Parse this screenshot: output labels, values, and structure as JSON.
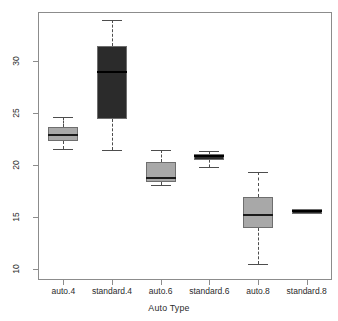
{
  "chart_data": {
    "type": "box",
    "title": "",
    "xlabel": "Auto Type",
    "ylabel": "",
    "ylim": [
      9.0,
      34.6
    ],
    "grid": false,
    "legend": "none",
    "y_ticks": [
      30,
      25,
      20,
      15,
      10
    ],
    "y_tick_labels": [
      "30",
      "25",
      "20",
      "15",
      "10"
    ],
    "categories": [
      "auto.4",
      "standard.4",
      "auto.6",
      "standard.6",
      "auto.8",
      "standard.8"
    ],
    "box_fill_colors": [
      "#a8a8a8",
      "#2b2b2b",
      "#a8a8a8",
      "#2b2b2b",
      "#a8a8a8",
      "#2b2b2b"
    ],
    "boxes": [
      {
        "category": "auto.4",
        "fill": "light",
        "whisker_low": 21.5,
        "q1": 22.3,
        "median": 22.9,
        "q3": 23.6,
        "whisker_high": 24.6
      },
      {
        "category": "standard.4",
        "fill": "dark",
        "whisker_low": 21.4,
        "q1": 24.4,
        "median": 28.9,
        "q3": 31.4,
        "whisker_high": 33.9
      },
      {
        "category": "auto.6",
        "fill": "light",
        "whisker_low": 18.0,
        "q1": 18.3,
        "median": 18.7,
        "q3": 20.3,
        "whisker_high": 21.4
      },
      {
        "category": "standard.6",
        "fill": "dark",
        "whisker_low": 19.8,
        "q1": 20.5,
        "median": 20.8,
        "q3": 21.0,
        "whisker_high": 21.3
      },
      {
        "category": "auto.8",
        "fill": "light",
        "whisker_low": 10.4,
        "q1": 13.9,
        "median": 15.2,
        "q3": 16.9,
        "whisker_high": 19.3
      },
      {
        "category": "standard.8",
        "fill": "dark",
        "whisker_low": 15.3,
        "q1": 15.3,
        "median": 15.5,
        "q3": 15.7,
        "whisker_high": 15.7
      }
    ]
  },
  "axis": {
    "x_title": "Auto Type",
    "y_tick_0": "30",
    "y_tick_1": "25",
    "y_tick_2": "20",
    "y_tick_3": "15",
    "y_tick_4": "10"
  }
}
